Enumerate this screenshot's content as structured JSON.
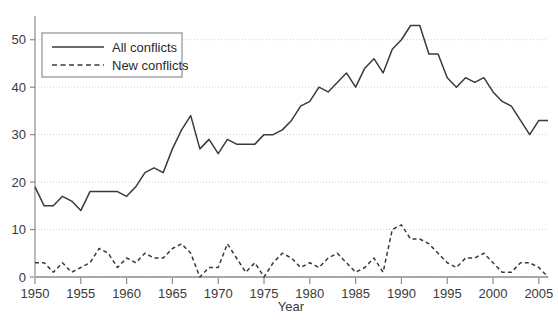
{
  "chart_data": {
    "type": "line",
    "title": "",
    "xlabel": "Year",
    "ylabel": "",
    "xlim": [
      1950,
      2006
    ],
    "ylim": [
      0,
      55
    ],
    "grid": true,
    "grid_axis": "y",
    "legend_position": "upper-left",
    "xticks": [
      1950,
      1955,
      1960,
      1965,
      1970,
      1975,
      1980,
      1985,
      1990,
      1995,
      2000,
      2005
    ],
    "yticks": [
      0,
      10,
      20,
      30,
      40,
      50
    ],
    "x": [
      1950,
      1951,
      1952,
      1953,
      1954,
      1955,
      1956,
      1957,
      1958,
      1959,
      1960,
      1961,
      1962,
      1963,
      1964,
      1965,
      1966,
      1967,
      1968,
      1969,
      1970,
      1971,
      1972,
      1973,
      1974,
      1975,
      1976,
      1977,
      1978,
      1979,
      1980,
      1981,
      1982,
      1983,
      1984,
      1985,
      1986,
      1987,
      1988,
      1989,
      1990,
      1991,
      1992,
      1993,
      1994,
      1995,
      1996,
      1997,
      1998,
      1999,
      2000,
      2001,
      2002,
      2003,
      2004,
      2005,
      2006
    ],
    "series": [
      {
        "name": "All conflicts",
        "style": "solid",
        "color": "#3a3a3a",
        "values": [
          19,
          15,
          15,
          17,
          16,
          14,
          18,
          18,
          18,
          18,
          17,
          19,
          22,
          23,
          22,
          27,
          31,
          34,
          27,
          29,
          26,
          29,
          28,
          28,
          28,
          30,
          30,
          31,
          33,
          36,
          37,
          40,
          39,
          41,
          43,
          40,
          44,
          46,
          43,
          48,
          50,
          53,
          53,
          47,
          47,
          42,
          40,
          42,
          41,
          42,
          39,
          37,
          36,
          33,
          30,
          33,
          33
        ]
      },
      {
        "name": "New conflicts",
        "style": "dashed",
        "color": "#3a3a3a",
        "values": [
          3,
          3,
          1,
          3,
          1,
          2,
          3,
          6,
          5,
          2,
          4,
          3,
          5,
          4,
          4,
          6,
          7,
          5,
          0,
          2,
          2,
          7,
          4,
          1,
          3,
          0,
          3,
          5,
          4,
          2,
          3,
          2,
          4,
          5,
          3,
          1,
          2,
          4,
          1,
          10,
          11,
          8,
          8,
          7,
          5,
          3,
          2,
          4,
          4,
          5,
          3,
          1,
          1,
          3,
          3,
          2,
          0
        ]
      }
    ]
  },
  "legend": {
    "entries": [
      {
        "label": "All conflicts",
        "style": "solid"
      },
      {
        "label": "New conflicts",
        "style": "dashed"
      }
    ]
  },
  "axes": {
    "x_title": "Year",
    "x_tick_labels": [
      "1950",
      "1955",
      "1960",
      "1965",
      "1970",
      "1975",
      "1980",
      "1985",
      "1990",
      "1995",
      "2000",
      "2005"
    ],
    "y_tick_labels": [
      "0",
      "10",
      "20",
      "30",
      "40",
      "50"
    ]
  },
  "colors": {
    "line": "#3a3a3a",
    "axis": "#8c8c8c",
    "grid": "#cfcfcf",
    "text": "#3a3a3a",
    "background": "#ffffff"
  }
}
